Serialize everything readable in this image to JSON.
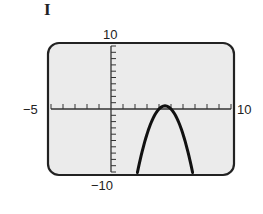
{
  "panel_label": "I",
  "colors": {
    "screen_bg": "#ebebeb",
    "frame": "#222222",
    "curve": "#111111",
    "axis": "#333333"
  },
  "chart_data": {
    "type": "line",
    "title": "",
    "xlabel": "",
    "ylabel": "",
    "xlim": [
      -5,
      10
    ],
    "ylim": [
      -10,
      10
    ],
    "xscale_tick": 1,
    "yscale_tick": 1,
    "grid": false,
    "legend": null,
    "axis_labels": {
      "xmin": "−5",
      "xmax": "10",
      "ymin": "−10",
      "ymax": "10"
    },
    "series": [
      {
        "name": "parabola",
        "description": "downward-opening parabola, vertex approx (4.5, 0.5)",
        "x": [
          2.2,
          2.5,
          3.0,
          3.5,
          4.0,
          4.5,
          5.0,
          5.5,
          6.0,
          6.5,
          6.8
        ],
        "y": [
          -10.08,
          -7.5,
          -4.0,
          -1.5,
          0.0,
          0.5,
          0.0,
          -1.5,
          -4.0,
          -7.5,
          -10.08
        ]
      }
    ]
  }
}
